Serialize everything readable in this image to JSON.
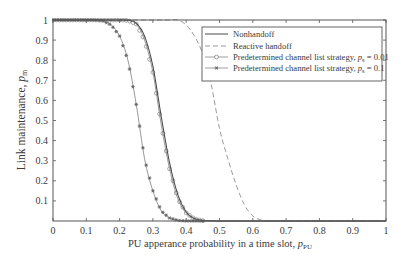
{
  "figure": {
    "xlabel": {
      "prefix": "PU apperance probability in a time slot, ",
      "var": "p",
      "sub": "PU"
    },
    "ylabel": {
      "prefix": "Link maintenance, ",
      "var": "p",
      "sub": "m"
    },
    "legend": {
      "items": [
        {
          "prefix": "Nonhandoff",
          "var": "",
          "sub": "",
          "suffix": ""
        },
        {
          "prefix": "Reactive handoff",
          "var": "",
          "sub": "",
          "suffix": ""
        },
        {
          "prefix": "Predetermined channel list strategy, ",
          "var": "p",
          "sub": "s",
          "suffix": " = 0.01"
        },
        {
          "prefix": "Predetermined channel list strategy, ",
          "var": "p",
          "sub": "s",
          "suffix": " = 0.1"
        }
      ]
    },
    "colors": {
      "axes": "#555555",
      "text": "#3a3a3a",
      "nonhandoff": "#4a4a4a",
      "reactive": "#9a9a9a",
      "ps001": "#858585",
      "ps01": "#858585",
      "marker_ps01": "#6a6a6a"
    }
  },
  "chart_data": {
    "type": "line",
    "title": "",
    "xlabel": "PU apperance probability in a time slot, p_PU",
    "ylabel": "Link maintenance, p_m",
    "xlim": [
      0,
      1
    ],
    "ylim": [
      0,
      1
    ],
    "xticks": [
      0,
      0.1,
      0.2,
      0.3,
      0.4,
      0.5,
      0.6,
      0.7,
      0.8,
      0.9,
      1
    ],
    "xtick_labels": [
      "0",
      "0.1",
      "0.2",
      "0.3",
      "0.4",
      "0.5",
      "0.6",
      "0.7",
      "0.8",
      "0.9",
      "1"
    ],
    "yticks": [
      0.1,
      0.2,
      0.3,
      0.4,
      0.5,
      0.6,
      0.7,
      0.8,
      0.9,
      1
    ],
    "ytick_labels": [
      "0.1",
      "0.2",
      "0.3",
      "0.4",
      "0.5",
      "0.6",
      "0.7",
      "0.8",
      "0.9",
      "1"
    ],
    "grid": false,
    "legend_position": "upper right",
    "marker_x_range": [
      0,
      0.45
    ],
    "marker_step": 0.01,
    "x": [
      0,
      0.025,
      0.05,
      0.075,
      0.1,
      0.125,
      0.15,
      0.175,
      0.2,
      0.225,
      0.25,
      0.275,
      0.3,
      0.325,
      0.35,
      0.375,
      0.4,
      0.425,
      0.45,
      0.475,
      0.5,
      0.525,
      0.55,
      0.575,
      0.6,
      0.625,
      0.65,
      0.675,
      0.7,
      0.725,
      0.75,
      0.775,
      0.8,
      0.825,
      0.85,
      0.875,
      0.9,
      0.925,
      0.95,
      0.975,
      1.0
    ],
    "series": [
      {
        "name": "Nonhandoff",
        "style": "solid",
        "marker": "none",
        "color_key": "nonhandoff",
        "values": [
          1,
          1,
          1,
          1,
          1,
          1,
          1,
          1,
          1,
          0.999,
          0.985,
          0.92,
          0.77,
          0.52,
          0.29,
          0.13,
          0.045,
          0.012,
          0.003,
          0.001,
          0,
          0,
          0,
          0,
          0,
          0,
          0,
          0,
          0,
          0,
          0,
          0,
          0,
          0,
          0,
          0,
          0,
          0,
          0,
          0,
          0
        ]
      },
      {
        "name": "Reactive handoff",
        "style": "dashed",
        "marker": "none",
        "color_key": "reactive",
        "values": [
          1,
          1,
          1,
          1,
          1,
          1,
          1,
          1,
          1,
          1,
          1,
          1,
          1,
          1,
          1,
          1,
          0.975,
          0.92,
          0.83,
          0.68,
          0.46,
          0.31,
          0.18,
          0.08,
          0.025,
          0.005,
          0,
          0,
          0,
          0,
          0,
          0,
          0,
          0,
          0,
          0,
          0,
          0,
          0,
          0,
          0
        ]
      },
      {
        "name": "Predetermined channel list strategy, p_s = 0.01",
        "style": "solid",
        "marker": "circle",
        "color_key": "ps001",
        "values": [
          1,
          1,
          1,
          1,
          1,
          1,
          1,
          1,
          1,
          0.998,
          0.98,
          0.9,
          0.74,
          0.48,
          0.26,
          0.11,
          0.04,
          0.01,
          0.002,
          0,
          0,
          0,
          0,
          0,
          0,
          0,
          0,
          0,
          0,
          0,
          0,
          0,
          0,
          0,
          0,
          0,
          0,
          0,
          0,
          0,
          0
        ]
      },
      {
        "name": "Predetermined channel list strategy, p_s = 0.1",
        "style": "solid",
        "marker": "star",
        "color_key": "ps01",
        "values": [
          1,
          1,
          1,
          1,
          1,
          1,
          0.995,
          0.975,
          0.92,
          0.8,
          0.58,
          0.31,
          0.15,
          0.05,
          0.015,
          0.003,
          0,
          0,
          0,
          0,
          0,
          0,
          0,
          0,
          0,
          0,
          0,
          0,
          0,
          0,
          0,
          0,
          0,
          0,
          0,
          0,
          0,
          0,
          0,
          0,
          0
        ]
      }
    ]
  }
}
